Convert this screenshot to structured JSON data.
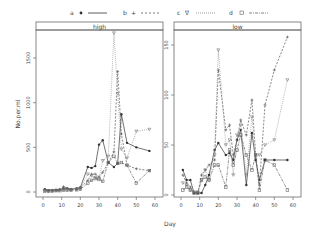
{
  "chart_data": {
    "type": "line",
    "title": "",
    "xlabel": "Day",
    "ylabel": "No.per.ml",
    "legend": {
      "position": "top",
      "entries": [
        {
          "name": "a",
          "marker": "•",
          "line": "solid",
          "color": "#333333"
        },
        {
          "name": "b",
          "marker": "+",
          "line": "dashed",
          "color": "#555555"
        },
        {
          "name": "c",
          "marker": "∇",
          "line": "dotted",
          "color": "#888888"
        },
        {
          "name": "d",
          "marker": "□",
          "line": "dashdot",
          "color": "#666666"
        }
      ]
    },
    "panels": [
      {
        "strip": "high",
        "xlim": [
          0,
          60
        ],
        "ylim": [
          0,
          1600
        ],
        "xticks": [
          0,
          10,
          20,
          30,
          40,
          50,
          60
        ],
        "yticks": [
          0,
          500,
          1000,
          1500
        ],
        "series": [
          {
            "name": "a",
            "x": [
              1,
              3,
              5,
              7,
              9,
              11,
              13,
              15,
              18,
              20,
              24,
              26,
              28,
              30,
              32,
              35,
              38,
              40,
              42,
              45,
              50,
              57
            ],
            "y": [
              30,
              20,
              20,
              20,
              25,
              40,
              40,
              30,
              40,
              50,
              280,
              270,
              290,
              530,
              580,
              330,
              280,
              320,
              870,
              550,
              500,
              460
            ]
          },
          {
            "name": "b",
            "x": [
              1,
              3,
              5,
              7,
              9,
              11,
              13,
              15,
              18,
              20,
              24,
              26,
              28,
              30,
              32,
              35,
              38,
              40,
              42,
              45,
              50,
              57
            ],
            "y": [
              20,
              15,
              15,
              20,
              30,
              60,
              40,
              30,
              35,
              45,
              130,
              200,
              200,
              170,
              220,
              330,
              450,
              1350,
              650,
              300,
              260,
              240
            ]
          },
          {
            "name": "c",
            "x": [
              1,
              3,
              5,
              7,
              9,
              11,
              13,
              15,
              18,
              20,
              24,
              26,
              28,
              30,
              32,
              35,
              38,
              40,
              42,
              45,
              50,
              57
            ],
            "y": [
              15,
              10,
              15,
              20,
              20,
              30,
              25,
              25,
              30,
              40,
              200,
              180,
              160,
              150,
              350,
              400,
              1800,
              1100,
              480,
              380,
              680,
              700
            ]
          },
          {
            "name": "d",
            "x": [
              1,
              3,
              5,
              7,
              9,
              11,
              13,
              15,
              18,
              20,
              24,
              26,
              28,
              30,
              32,
              35,
              38,
              40,
              42,
              45,
              50,
              57
            ],
            "y": [
              10,
              10,
              10,
              15,
              15,
              20,
              20,
              20,
              25,
              30,
              100,
              130,
              150,
              140,
              120,
              330,
              400,
              320,
              330,
              300,
              100,
              240
            ]
          }
        ]
      },
      {
        "strip": "low",
        "xlim": [
          0,
          60
        ],
        "ylim": [
          0,
          160
        ],
        "xticks": [
          0,
          10,
          20,
          30,
          40,
          50,
          60
        ],
        "yticks": [
          0,
          50,
          100,
          150
        ],
        "series": [
          {
            "name": "a",
            "x": [
              1,
              3,
              5,
              7,
              9,
              11,
              13,
              15,
              18,
              20,
              24,
              26,
              28,
              30,
              32,
              35,
              38,
              40,
              42,
              45,
              50,
              57
            ],
            "y": [
              25,
              15,
              15,
              2,
              2,
              2,
              10,
              20,
              45,
              52,
              40,
              42,
              35,
              55,
              65,
              10,
              62,
              35,
              15,
              35,
              35,
              35
            ]
          },
          {
            "name": "b",
            "x": [
              1,
              3,
              5,
              7,
              9,
              11,
              13,
              15,
              18,
              20,
              24,
              26,
              28,
              30,
              32,
              35,
              38,
              40,
              42,
              45,
              50,
              57
            ],
            "y": [
              20,
              12,
              8,
              2,
              2,
              20,
              25,
              30,
              35,
              125,
              65,
              70,
              40,
              55,
              75,
              60,
              95,
              40,
              10,
              90,
              125,
              158
            ]
          },
          {
            "name": "c",
            "x": [
              1,
              3,
              5,
              7,
              9,
              11,
              13,
              15,
              18,
              20,
              24,
              26,
              28,
              30,
              32,
              35,
              38,
              40,
              42,
              45,
              50,
              57
            ],
            "y": [
              12,
              10,
              5,
              3,
              3,
              15,
              25,
              15,
              40,
              145,
              50,
              55,
              20,
              60,
              70,
              20,
              78,
              40,
              40,
              50,
              55,
              115
            ]
          },
          {
            "name": "d",
            "x": [
              1,
              3,
              5,
              7,
              9,
              11,
              13,
              15,
              18,
              20,
              24,
              26,
              28,
              30,
              32,
              35,
              38,
              40,
              42,
              45,
              50,
              57
            ],
            "y": [
              5,
              8,
              5,
              2,
              2,
              15,
              18,
              15,
              30,
              30,
              8,
              45,
              30,
              45,
              60,
              40,
              25,
              40,
              5,
              35,
              30,
              5
            ]
          }
        ]
      }
    ]
  },
  "labels": {
    "xlabel": "Day",
    "ylabel": "No.per.ml",
    "strip_left": "high",
    "strip_right": "low",
    "legend_a": "a",
    "legend_b": "b",
    "legend_c": "c",
    "legend_d": "d"
  }
}
